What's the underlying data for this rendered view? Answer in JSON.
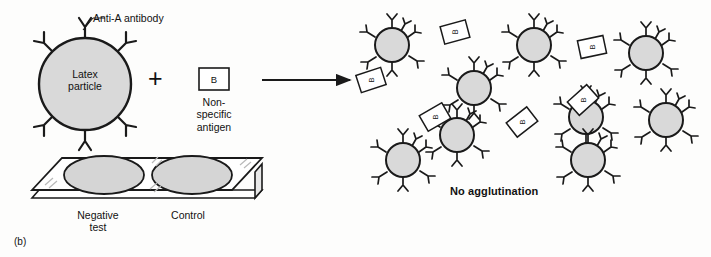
{
  "figure": {
    "panel_label": "(b)",
    "type": "diagram"
  },
  "left_panel": {
    "antibody_label": "Anti-A antibody",
    "particle_label_line1": "Latex",
    "particle_label_line2": "particle",
    "plus_sign": "+",
    "antigen_box_letter": "B",
    "antigen_label_line1": "Non-",
    "antigen_label_line2": "specific",
    "antigen_label_line3": "antigen",
    "arrow": "reaction-arrow"
  },
  "right_panel": {
    "result_label": "No agglutination",
    "particle_count": 9,
    "antigen_count": 6,
    "antigen_letter": "B"
  },
  "slide": {
    "well_left_label_line1": "Negative",
    "well_left_label_line2": "test",
    "well_right_label": "Control"
  },
  "colors": {
    "particle_fill": "#d9d9d9",
    "well_fill": "#d5d5d5",
    "outline": "#1a1a1a",
    "slide_face": "#ffffff",
    "background": "#fdfdfc"
  },
  "geometry": {
    "main_particle": {
      "cx": 85,
      "cy": 84,
      "r": 46
    },
    "antigen_box": {
      "x": 199,
      "y": 68,
      "w": 30,
      "h": 22
    },
    "arrow": {
      "x1": 262,
      "y1": 80,
      "x2": 352,
      "y2": 80
    },
    "slide": {
      "x": 28,
      "y": 155,
      "w": 222,
      "h": 55
    },
    "right_particles": [
      {
        "cx": 392,
        "cy": 45,
        "r": 17,
        "spikes": 7
      },
      {
        "cx": 534,
        "cy": 45,
        "r": 17,
        "spikes": 7
      },
      {
        "cx": 646,
        "cy": 53,
        "r": 17,
        "spikes": 7
      },
      {
        "cx": 474,
        "cy": 88,
        "r": 17,
        "spikes": 7
      },
      {
        "cx": 586,
        "cy": 117,
        "r": 17,
        "spikes": 7
      },
      {
        "cx": 666,
        "cy": 120,
        "r": 17,
        "spikes": 7
      },
      {
        "cx": 403,
        "cy": 160,
        "r": 17,
        "spikes": 7
      },
      {
        "cx": 588,
        "cy": 160,
        "r": 17,
        "spikes": 7
      },
      {
        "cx": 457,
        "cy": 135,
        "r": 17,
        "spikes": 7
      }
    ],
    "right_antigens": [
      {
        "cx": 455,
        "cy": 32,
        "w": 26,
        "h": 18,
        "rot": -15
      },
      {
        "cx": 371,
        "cy": 80,
        "w": 26,
        "h": 18,
        "rot": -18
      },
      {
        "cx": 592,
        "cy": 47,
        "w": 26,
        "h": 18,
        "rot": -12
      },
      {
        "cx": 435,
        "cy": 117,
        "w": 26,
        "h": 18,
        "rot": -30
      },
      {
        "cx": 583,
        "cy": 100,
        "w": 26,
        "h": 18,
        "rot": -42
      },
      {
        "cx": 522,
        "cy": 122,
        "w": 26,
        "h": 18,
        "rot": -38
      }
    ]
  }
}
